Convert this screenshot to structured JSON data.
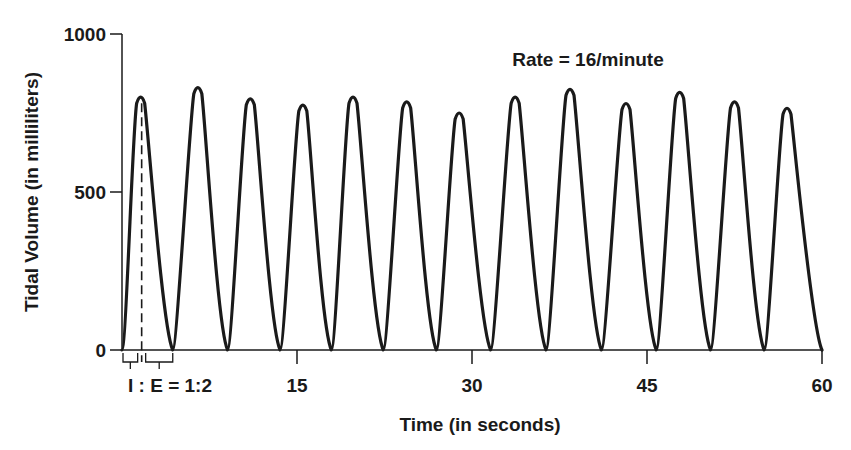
{
  "chart_data": {
    "type": "line",
    "title": "",
    "annotation": "Rate = 16/minute",
    "ie_annotation": "I : E = 1:2",
    "xlabel": "Time (in seconds)",
    "ylabel": "Tidal Volume (in milliliters)",
    "xlim": [
      0,
      60
    ],
    "ylim": [
      0,
      1000
    ],
    "x_ticks": [
      0,
      15,
      30,
      45,
      60
    ],
    "x_tick_labels": [
      "",
      "15",
      "30",
      "45",
      "60"
    ],
    "y_ticks": [
      0,
      500,
      1000
    ],
    "y_tick_labels": [
      "0",
      "500",
      "1000"
    ],
    "grid": false,
    "legend": null,
    "series": [
      {
        "name": "Tidal volume waveform",
        "breath_peak_times_s": [
          1.6,
          6.5,
          11.0,
          15.5,
          19.8,
          24.4,
          28.9,
          33.7,
          38.4,
          43.2,
          47.8,
          52.5,
          57.0
        ],
        "breath_peak_volumes_ml": [
          800,
          830,
          795,
          775,
          800,
          785,
          750,
          800,
          825,
          780,
          815,
          785,
          765
        ],
        "trough_volume_ml": 0
      }
    ],
    "colors": {
      "line": "#1a1a1a",
      "axis": "#1a1a1a",
      "background": "#ffffff"
    }
  }
}
